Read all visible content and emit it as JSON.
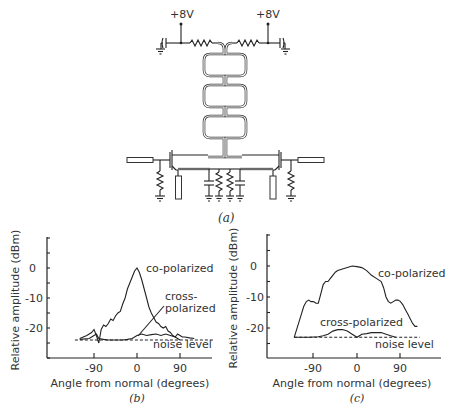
{
  "circuit": {
    "supply_left": "+8V",
    "supply_right": "+8V",
    "caption": "(a)"
  },
  "chart_data": [
    {
      "panel": "b",
      "type": "line",
      "caption": "(b)",
      "title": "",
      "xlabel": "Angle from normal (degrees)",
      "ylabel": "Relative amplitude (dBm)",
      "x_ticks": [
        -90,
        0,
        90
      ],
      "y_ticks": [
        0,
        -10,
        -20
      ],
      "xlim": [
        -150,
        160
      ],
      "ylim": [
        -30,
        10
      ],
      "grid": false,
      "series": [
        {
          "name": "co-polarized",
          "x": [
            -120,
            -105,
            -95,
            -90,
            -85,
            -80,
            -75,
            -70,
            -65,
            -60,
            -55,
            -50,
            -45,
            -40,
            -35,
            -30,
            -25,
            -20,
            -15,
            -10,
            -5,
            0,
            5,
            10,
            15,
            20,
            25,
            30,
            35,
            40,
            45,
            50,
            55,
            60,
            65,
            70,
            75,
            80,
            85,
            90,
            95,
            100,
            110,
            120
          ],
          "values": [
            -23.5,
            -22.5,
            -21.5,
            -20.5,
            -22.5,
            -25,
            -20.5,
            -19,
            -19.5,
            -18.5,
            -17,
            -17.5,
            -16,
            -15,
            -14.5,
            -12,
            -10,
            -7,
            -5,
            -3,
            -1,
            0,
            -1.5,
            -4,
            -7,
            -10,
            -13,
            -15,
            -16.5,
            -18,
            -18.5,
            -19.5,
            -20,
            -19.5,
            -21,
            -21.5,
            -22.5,
            -23,
            -22,
            -22.5,
            -23,
            -23,
            -23.3,
            -23.5
          ]
        },
        {
          "name": "cross-polarized",
          "x": [
            -120,
            -100,
            -90,
            -85,
            -80,
            -70,
            -60,
            -50,
            -40,
            -30,
            -20,
            -10,
            0,
            10,
            20,
            30,
            40,
            50,
            60,
            70,
            80,
            90
          ],
          "values": [
            -23.8,
            -23.5,
            -22.5,
            -22,
            -23.5,
            -23.8,
            -24,
            -24,
            -24,
            -24,
            -23.8,
            -23.5,
            -22.5,
            -22,
            -22.5,
            -22.2,
            -22,
            -22.5,
            -22,
            -22.5,
            -23,
            -24
          ]
        },
        {
          "name": "noise level",
          "style": "dashed",
          "x": [
            -130,
            160
          ],
          "values": [
            -24,
            -24
          ]
        }
      ],
      "annotations": [
        "co-polarized",
        "cross-polarized",
        "noise level"
      ]
    },
    {
      "panel": "c",
      "type": "line",
      "caption": "(c)",
      "title": "",
      "xlabel": "Angle from normal (degrees)",
      "ylabel": "Relative amplitude (dBm)",
      "x_ticks": [
        -90,
        0,
        90
      ],
      "y_ticks": [
        0,
        -10,
        -20
      ],
      "xlim": [
        -190,
        170
      ],
      "ylim": [
        -30,
        10
      ],
      "grid": false,
      "series": [
        {
          "name": "co-polarized",
          "x": [
            -130,
            -125,
            -120,
            -115,
            -110,
            -105,
            -100,
            -95,
            -90,
            -85,
            -80,
            -75,
            -70,
            -65,
            -60,
            -55,
            -50,
            -45,
            -40,
            -30,
            -20,
            -10,
            0,
            10,
            20,
            30,
            40,
            50,
            55,
            60,
            65,
            70,
            75,
            80,
            85,
            90,
            95,
            100,
            105,
            110,
            115,
            120,
            125
          ],
          "values": [
            -23,
            -20.5,
            -18,
            -15.5,
            -13,
            -11.5,
            -11,
            -11.5,
            -11.5,
            -12,
            -12,
            -9,
            -6,
            -5,
            -5,
            -4,
            -3,
            -2,
            -1.5,
            -1,
            -0.5,
            0,
            -0.2,
            -0.5,
            -1.5,
            -3,
            -4,
            -5,
            -7,
            -10,
            -11.5,
            -12,
            -11.5,
            -11,
            -11,
            -11.5,
            -12.5,
            -14,
            -15.5,
            -17,
            -18.5,
            -19.5,
            -19.5
          ]
        },
        {
          "name": "cross-polarized",
          "x": [
            -130,
            -100,
            -80,
            -70,
            -60,
            -50,
            -40,
            -30,
            -20,
            -10,
            0,
            10,
            20,
            30,
            40,
            50,
            60,
            70,
            80
          ],
          "values": [
            -23,
            -23,
            -22.8,
            -22.5,
            -22,
            -21,
            -20.5,
            -20.5,
            -21,
            -22,
            -23,
            -22,
            -21.8,
            -21.5,
            -21.5,
            -21.5,
            -22,
            -22.5,
            -23
          ]
        },
        {
          "name": "noise level",
          "style": "dashed",
          "x": [
            -130,
            130
          ],
          "values": [
            -23,
            -23
          ]
        }
      ],
      "annotations": [
        "co-polarized",
        "cross-polarized",
        "noise level"
      ]
    }
  ],
  "labels": {
    "b": {
      "co": "co-polarized",
      "cross_1": "cross-",
      "cross_2": "polarized",
      "noise": "noise level",
      "xlabel": "Angle from normal (degrees)",
      "ylabel": "Relative amplitude (dBm)",
      "tick_x": [
        "-90",
        "0",
        "90"
      ],
      "tick_y": [
        "0",
        "-10",
        "-20"
      ],
      "caption": "(b)"
    },
    "c": {
      "co": "co-polarized",
      "cross": "cross-polarized",
      "noise": "noise level",
      "xlabel": "Angle from normal (degrees)",
      "ylabel": "Relative amplitude (dBm)",
      "tick_x": [
        "-90",
        "0",
        "90"
      ],
      "tick_y": [
        "0",
        "-10",
        "-20"
      ],
      "caption": "(c)"
    }
  }
}
